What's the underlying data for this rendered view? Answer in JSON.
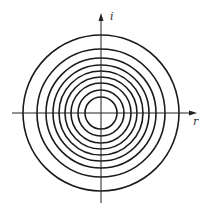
{
  "diagram": {
    "type": "concentric-circles-on-axes",
    "center": {
      "x": 101,
      "y": 113
    },
    "radii": [
      78,
      64,
      55,
      48,
      42,
      36,
      30,
      23,
      16
    ],
    "circle_count": 9,
    "stroke_color": "#1a1a1a",
    "axis_color": "#222222",
    "axes": {
      "horizontal": {
        "label": "r",
        "x_start": 12,
        "x_end": 197
      },
      "vertical": {
        "label": "i",
        "y_start": 203,
        "y_end": 13
      }
    }
  }
}
